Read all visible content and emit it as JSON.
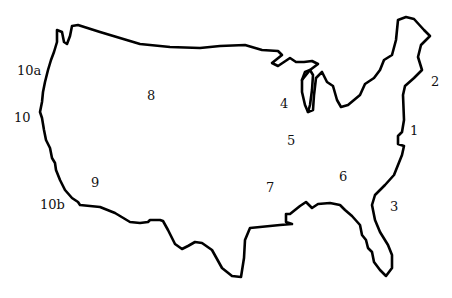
{
  "map": {
    "title": "",
    "outline_color": "#000000",
    "background": "#ffffff",
    "labels": [
      {
        "id": "1",
        "text": "1",
        "x": 410,
        "y": 130
      },
      {
        "id": "2",
        "text": "2",
        "x": 431,
        "y": 78
      },
      {
        "id": "3",
        "text": "3",
        "x": 390,
        "y": 202
      },
      {
        "id": "4",
        "text": "4",
        "x": 280,
        "y": 97
      },
      {
        "id": "5",
        "text": "5",
        "x": 287,
        "y": 136
      },
      {
        "id": "6",
        "text": "6",
        "x": 339,
        "y": 172
      },
      {
        "id": "7",
        "text": "7",
        "x": 266,
        "y": 182
      },
      {
        "id": "8",
        "text": "8",
        "x": 147,
        "y": 90
      },
      {
        "id": "9",
        "text": "9",
        "x": 91,
        "y": 177
      },
      {
        "id": "10",
        "text": "10",
        "x": 14,
        "y": 110
      },
      {
        "id": "10a",
        "text": "10a",
        "x": 17,
        "y": 62
      },
      {
        "id": "10b",
        "text": "10b",
        "x": 40,
        "y": 197
      }
    ]
  }
}
